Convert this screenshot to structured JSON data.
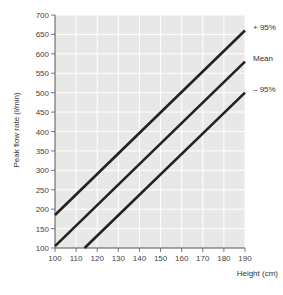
{
  "chart_data": {
    "type": "line",
    "title": "",
    "xlabel": "Height (cm)",
    "ylabel": "Peak flow rate (l/min)",
    "xlim": [
      100,
      190
    ],
    "ylim": [
      100,
      700
    ],
    "x_ticks": [
      100,
      110,
      120,
      130,
      140,
      150,
      160,
      170,
      180,
      190
    ],
    "y_ticks": [
      100,
      150,
      200,
      250,
      300,
      350,
      400,
      450,
      500,
      550,
      600,
      650,
      700
    ],
    "grid": true,
    "legend_position": "right-inline",
    "series": [
      {
        "name": "+ 95%",
        "points": [
          [
            100,
            185
          ],
          [
            190,
            660
          ]
        ]
      },
      {
        "name": "Mean",
        "points": [
          [
            100,
            105
          ],
          [
            190,
            580
          ]
        ]
      },
      {
        "name": "– 95%",
        "points": [
          [
            114,
            100
          ],
          [
            190,
            500
          ]
        ]
      }
    ],
    "colors": {
      "background": "#e8e8e8",
      "grid": "#ffffff",
      "line": "#222222",
      "axis": "#555555"
    }
  }
}
